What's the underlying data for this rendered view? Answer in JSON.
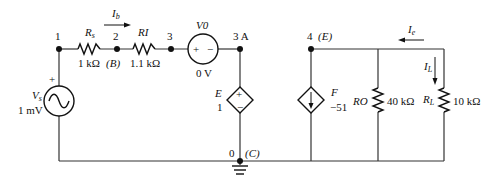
{
  "circuit": {
    "nodes": [
      {
        "id": "1",
        "label": "1"
      },
      {
        "id": "2",
        "label": "2",
        "alias": "(B)"
      },
      {
        "id": "3",
        "label": "3"
      },
      {
        "id": "3A",
        "label": "3 A"
      },
      {
        "id": "4",
        "label": "4",
        "alias": "(E)"
      },
      {
        "id": "0",
        "label": "0",
        "alias": "(C)"
      }
    ],
    "vs": {
      "name": "V",
      "sub": "s",
      "value": "1 mV",
      "plus": "+"
    },
    "rs": {
      "name": "R",
      "sub": "s",
      "value": "1 kΩ"
    },
    "ri": {
      "name": "RI",
      "value": "1.1 kΩ"
    },
    "v0": {
      "name": "V0",
      "value": "0 V",
      "plus": "+",
      "minus": "−"
    },
    "e": {
      "name": "E",
      "value": "1",
      "plus": "+",
      "minus": "−"
    },
    "f": {
      "name": "F",
      "value": "−51"
    },
    "ro": {
      "name": "RO",
      "value": "40 kΩ"
    },
    "rl": {
      "name": "R",
      "sub": "L",
      "value": "10 kΩ"
    },
    "currents": {
      "ib": {
        "name": "I",
        "sub": "b"
      },
      "ie": {
        "name": "I",
        "sub": "e"
      },
      "il": {
        "name": "I",
        "sub": "L"
      }
    }
  }
}
